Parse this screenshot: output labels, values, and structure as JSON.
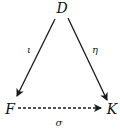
{
  "diagram": {
    "type": "commutative-triangle",
    "nodes": {
      "top": {
        "label": "D",
        "x": 62,
        "y": 12
      },
      "left": {
        "label": "F",
        "x": 9,
        "y": 113
      },
      "right": {
        "label": "K",
        "x": 111,
        "y": 113
      }
    },
    "edges": {
      "left": {
        "from": "D",
        "to": "F",
        "label": "ι",
        "style": "solid"
      },
      "right": {
        "from": "D",
        "to": "K",
        "label": "η",
        "style": "solid"
      },
      "bottom": {
        "from": "F",
        "to": "K",
        "label": "σ",
        "style": "dashed"
      }
    }
  }
}
